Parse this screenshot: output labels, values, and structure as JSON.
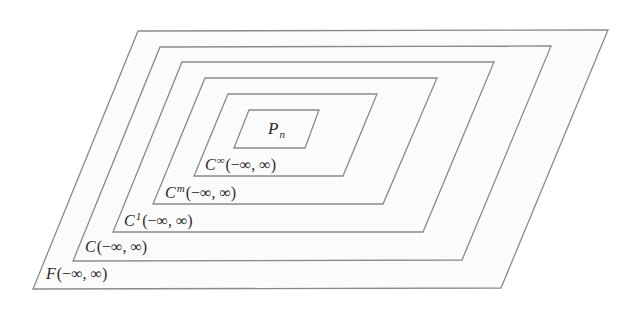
{
  "diagram": {
    "sets": [
      {
        "id": "F",
        "letter": "F",
        "sup": "",
        "sub": "",
        "interval": "(−∞, ∞)",
        "points": "138,31 608,30 501,288 33,289"
      },
      {
        "id": "C",
        "letter": "C",
        "sup": "",
        "sub": "",
        "interval": "(−∞, ∞)",
        "points": "160,47 551,46 462,260 73,261"
      },
      {
        "id": "C1",
        "letter": "C",
        "sup": "1",
        "sub": "",
        "interval": "(−∞, ∞)",
        "points": "182,62 494,62 423,232 113,232"
      },
      {
        "id": "Cm",
        "letter": "C",
        "sup": "m",
        "sub": "",
        "interval": "(−∞, ∞)",
        "points": "205,78 437,78 383,204 153,204"
      },
      {
        "id": "Cinf",
        "letter": "C",
        "sup": "∞",
        "sub": "",
        "interval": "(−∞, ∞)",
        "points": "228,94 377,94 343,176 194,176"
      },
      {
        "id": "Pn",
        "letter": "P",
        "sup": "",
        "sub": "n",
        "interval": "",
        "points": "249,110 319,110 305,148 234,148"
      }
    ],
    "labels": {
      "F": {
        "letter": "F",
        "interval": "(−∞, ∞)"
      },
      "C": {
        "letter": "C",
        "interval": "(−∞, ∞)"
      },
      "C1": {
        "letter": "C",
        "sup": "1",
        "interval": "(−∞, ∞)"
      },
      "Cm": {
        "letter": "C",
        "sup": "m",
        "interval": "(−∞, ∞)"
      },
      "Cinf": {
        "letter": "C",
        "sup": "∞",
        "interval": "(−∞, ∞)"
      },
      "Pn": {
        "letter": "P",
        "sub": "n"
      }
    },
    "colors": {
      "stroke": "#8a8a8a",
      "fill": "#fbfbfb",
      "text": "#2a2a2a"
    }
  }
}
